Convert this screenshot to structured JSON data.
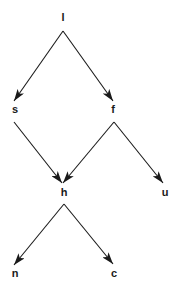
{
  "diagram": {
    "type": "directed-graph",
    "colors": {
      "background": "#ffffff",
      "ink": "#1a1a1a"
    },
    "nodes": [
      {
        "id": "l",
        "label": "l",
        "x": 63,
        "y": 21
      },
      {
        "id": "s",
        "label": "s",
        "x": 15,
        "y": 113
      },
      {
        "id": "f",
        "label": "f",
        "x": 113,
        "y": 113
      },
      {
        "id": "h",
        "label": "h",
        "x": 64,
        "y": 196
      },
      {
        "id": "u",
        "label": "u",
        "x": 165,
        "y": 196
      },
      {
        "id": "n",
        "label": "n",
        "x": 15,
        "y": 277
      },
      {
        "id": "c",
        "label": "c",
        "x": 114,
        "y": 277
      }
    ],
    "edges": [
      {
        "from": "l",
        "to": "s",
        "x1": 63,
        "y1": 31,
        "x2": 14,
        "y2": 101
      },
      {
        "from": "l",
        "to": "f",
        "x1": 63,
        "y1": 31,
        "x2": 113,
        "y2": 101
      },
      {
        "from": "s",
        "to": "h",
        "x1": 14,
        "y1": 122,
        "x2": 62,
        "y2": 183
      },
      {
        "from": "f",
        "to": "h",
        "x1": 114,
        "y1": 122,
        "x2": 63,
        "y2": 183
      },
      {
        "from": "f",
        "to": "u",
        "x1": 114,
        "y1": 122,
        "x2": 163,
        "y2": 183
      },
      {
        "from": "h",
        "to": "n",
        "x1": 64,
        "y1": 204,
        "x2": 14,
        "y2": 265
      },
      {
        "from": "h",
        "to": "c",
        "x1": 64,
        "y1": 204,
        "x2": 113,
        "y2": 264
      }
    ]
  }
}
